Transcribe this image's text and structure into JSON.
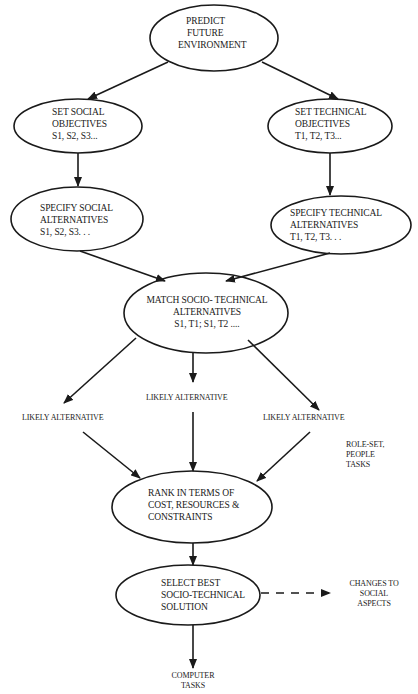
{
  "diagram": {
    "nodes": {
      "predict": {
        "lines": [
          "PREDICT",
          "FUTURE",
          "ENVIRONMENT"
        ]
      },
      "set_social": {
        "lines": [
          "SET SOCIAL",
          "OBJECTIVES",
          "S1, S2, S3..."
        ]
      },
      "set_technical": {
        "lines": [
          "SET TECHNICAL",
          "OBJECTIVES",
          "T1, T2, T3..."
        ]
      },
      "specify_social": {
        "lines": [
          "SPECIFY SOCIAL",
          "ALTERNATIVES",
          "S1, S2, S3. . ."
        ]
      },
      "specify_technical": {
        "lines": [
          "SPECIFY TECHNICAL",
          "ALTERNATIVES",
          "T1, T2, T3. . ."
        ]
      },
      "match": {
        "lines": [
          "MATCH SOCIO- TECHNICAL",
          "ALTERNATIVES",
          "S1, T1; S1, T2 ...."
        ]
      },
      "rank": {
        "lines": [
          "RANK IN TERMS OF",
          "COST, RESOURCES &",
          "CONSTRAINTS"
        ]
      },
      "select": {
        "lines": [
          "SELECT BEST",
          "SOCIO-TECHNICAL",
          "SOLUTION"
        ]
      }
    },
    "labels": {
      "likely_left": "LIKELY ALTERNATIVE",
      "likely_center": "LIKELY ALTERNATIVE",
      "likely_right": "LIKELY ALTERNATIVE",
      "role_set": [
        "ROLE-SET,",
        "PEOPLE",
        "TASKS"
      ],
      "changes": [
        "CHANGES TO",
        "SOCIAL",
        "ASPECTS"
      ],
      "computer_tasks": [
        "COMPUTER",
        "TASKS"
      ]
    },
    "edges": [
      {
        "from": "predict",
        "to": "set_social",
        "style": "solid"
      },
      {
        "from": "predict",
        "to": "set_technical",
        "style": "solid"
      },
      {
        "from": "set_social",
        "to": "specify_social",
        "style": "solid"
      },
      {
        "from": "set_technical",
        "to": "specify_technical",
        "style": "solid"
      },
      {
        "from": "specify_social",
        "to": "match",
        "style": "solid"
      },
      {
        "from": "specify_technical",
        "to": "match",
        "style": "solid"
      },
      {
        "from": "match",
        "to": "likely_left",
        "style": "solid"
      },
      {
        "from": "match",
        "to": "likely_center",
        "style": "solid"
      },
      {
        "from": "match",
        "to": "likely_right",
        "style": "solid"
      },
      {
        "from": "likely_left",
        "to": "rank",
        "style": "solid"
      },
      {
        "from": "likely_center",
        "to": "rank",
        "style": "solid"
      },
      {
        "from": "likely_right",
        "to": "rank",
        "style": "solid"
      },
      {
        "from": "rank",
        "to": "select",
        "style": "solid"
      },
      {
        "from": "select",
        "to": "changes",
        "style": "dashed"
      },
      {
        "from": "select",
        "to": "computer_tasks",
        "style": "solid"
      }
    ],
    "colors": {
      "stroke": "#1a1a1a",
      "background": "#ffffff"
    }
  }
}
